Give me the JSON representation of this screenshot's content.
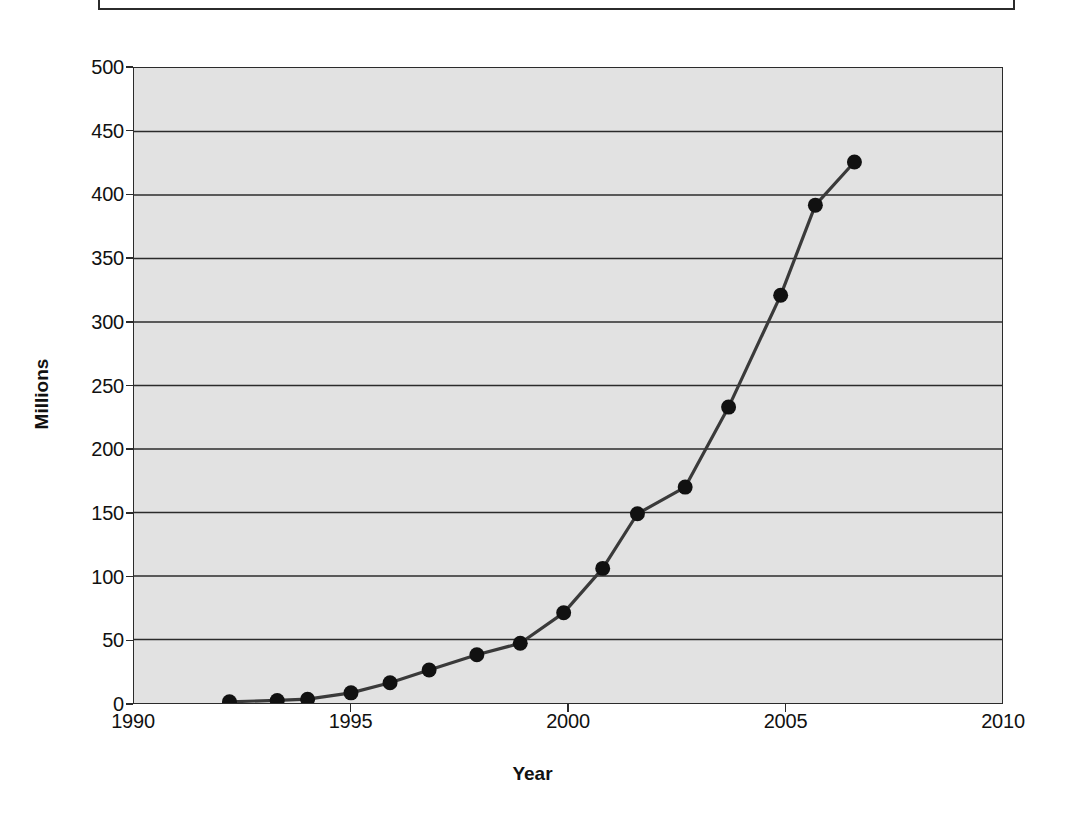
{
  "figure": {
    "background_color": "#ffffff",
    "plot_background_color": "#e2e2e2",
    "line_color": "#3a3a3a",
    "marker_color": "#111111",
    "axis_color": "#2b2b2b"
  },
  "chart_data": {
    "type": "line",
    "title": "",
    "xlabel": "Year",
    "ylabel": "Millions",
    "xlim": [
      1990,
      2010
    ],
    "ylim": [
      0,
      500
    ],
    "xticks": [
      1990,
      1995,
      2000,
      2005,
      2010
    ],
    "xtick_labels": [
      "1990",
      "1995",
      "2000",
      "2005",
      "2010"
    ],
    "yticks": [
      0,
      50,
      100,
      150,
      200,
      250,
      300,
      350,
      400,
      450,
      500
    ],
    "ytick_labels": [
      "0",
      "50",
      "100",
      "150",
      "200",
      "250",
      "300",
      "350",
      "400",
      "450",
      "500"
    ],
    "grid": "horizontal",
    "legend": "none",
    "markers": "filled-circle",
    "series": [
      {
        "name": "Hosts",
        "x": [
          1992.2,
          1993.3,
          1994.0,
          1995.0,
          1995.9,
          1996.8,
          1997.9,
          1998.9,
          1999.9,
          2000.8,
          2001.6,
          2002.7,
          2003.7,
          2004.9,
          2005.7,
          2006.6
        ],
        "values": [
          1,
          2,
          3,
          8,
          16,
          26,
          38,
          47,
          71,
          106,
          149,
          170,
          233,
          321,
          392,
          426
        ]
      }
    ]
  }
}
